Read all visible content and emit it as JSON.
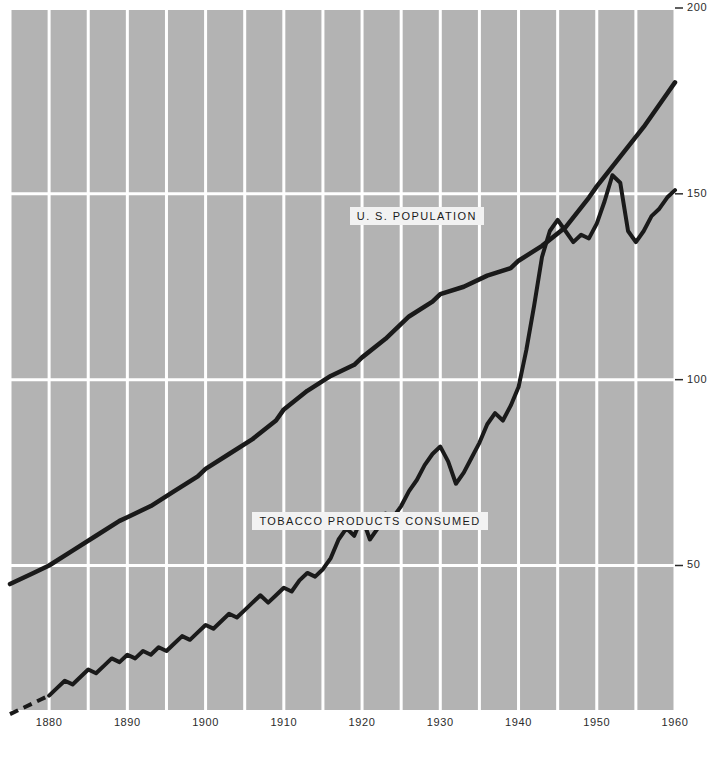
{
  "chart_data": {
    "type": "line",
    "title": "",
    "subtitle": "",
    "xlabel": "",
    "ylabel": "",
    "xlim": [
      1875,
      1960
    ],
    "ylim": [
      0,
      200
    ],
    "grid": true,
    "legend_position": "inline-labels",
    "background_color": "#b3b3b3",
    "gridline_color": "#ffffff",
    "line_color": "#1a1a1a",
    "x_ticks": [
      1880,
      1890,
      1900,
      1910,
      1920,
      1930,
      1940,
      1950,
      1960
    ],
    "x_tick_labels": [
      "1880",
      "1890",
      "1900",
      "1910",
      "1920",
      "1930",
      "1940",
      "1950",
      "1960"
    ],
    "x_minor_gridlines": [
      1875,
      1880,
      1885,
      1890,
      1895,
      1900,
      1905,
      1910,
      1915,
      1920,
      1925,
      1930,
      1935,
      1940,
      1945,
      1950,
      1955,
      1960
    ],
    "y_ticks": [
      50,
      100,
      150,
      200
    ],
    "y_tick_labels": [
      "50",
      "100",
      "150",
      "200"
    ],
    "annotations": [
      {
        "text": "U. S. POPULATION",
        "x": 1927,
        "y": 144
      },
      {
        "text": "TOBACCO PRODUCTS CONSUMED",
        "x": 1921,
        "y": 62
      }
    ],
    "series": [
      {
        "name": "U. S. POPULATION",
        "label": "U. S. POPULATION",
        "style": "solid",
        "x": [
          1875,
          1878,
          1880,
          1883,
          1886,
          1889,
          1890,
          1893,
          1896,
          1899,
          1900,
          1903,
          1906,
          1909,
          1910,
          1913,
          1916,
          1919,
          1920,
          1923,
          1926,
          1929,
          1930,
          1933,
          1936,
          1939,
          1940,
          1943,
          1946,
          1949,
          1950,
          1953,
          1956,
          1959,
          1960
        ],
        "values": [
          45,
          48,
          50,
          54,
          58,
          62,
          63,
          66,
          70,
          74,
          76,
          80,
          84,
          89,
          92,
          97,
          101,
          104,
          106,
          111,
          117,
          121,
          123,
          125,
          128,
          130,
          132,
          136,
          141,
          149,
          152,
          160,
          168,
          177,
          180
        ]
      },
      {
        "name": "TOBACCO PRODUCTS CONSUMED",
        "label": "TOBACCO PRODUCTS CONSUMED",
        "style": "dashed-then-solid",
        "dashed_until_x": 1880,
        "x": [
          1875,
          1877,
          1879,
          1880,
          1881,
          1882,
          1883,
          1884,
          1885,
          1886,
          1887,
          1888,
          1889,
          1890,
          1891,
          1892,
          1893,
          1894,
          1895,
          1896,
          1897,
          1898,
          1899,
          1900,
          1901,
          1902,
          1903,
          1904,
          1905,
          1906,
          1907,
          1908,
          1909,
          1910,
          1911,
          1912,
          1913,
          1914,
          1915,
          1916,
          1917,
          1918,
          1919,
          1920,
          1921,
          1922,
          1923,
          1924,
          1925,
          1926,
          1927,
          1928,
          1929,
          1930,
          1931,
          1932,
          1933,
          1934,
          1935,
          1936,
          1937,
          1938,
          1939,
          1940,
          1941,
          1942,
          1943,
          1944,
          1945,
          1946,
          1947,
          1948,
          1949,
          1950,
          1951,
          1952,
          1953,
          1954,
          1955,
          1956,
          1957,
          1958,
          1959,
          1960
        ],
        "values": [
          10,
          12,
          14,
          15,
          17,
          19,
          18,
          20,
          22,
          21,
          23,
          25,
          24,
          26,
          25,
          27,
          26,
          28,
          27,
          29,
          31,
          30,
          32,
          34,
          33,
          35,
          37,
          36,
          38,
          40,
          42,
          40,
          42,
          44,
          43,
          46,
          48,
          47,
          49,
          52,
          57,
          60,
          58,
          63,
          57,
          60,
          64,
          63,
          66,
          70,
          73,
          77,
          80,
          82,
          78,
          72,
          75,
          79,
          83,
          88,
          91,
          89,
          93,
          98,
          108,
          120,
          133,
          140,
          143,
          140,
          137,
          139,
          138,
          142,
          148,
          155,
          153,
          140,
          137,
          140,
          144,
          146,
          149,
          151
        ]
      }
    ]
  },
  "axes": {
    "y_axis_name": "population-and-consumption-index",
    "x_axis_name": "year"
  }
}
